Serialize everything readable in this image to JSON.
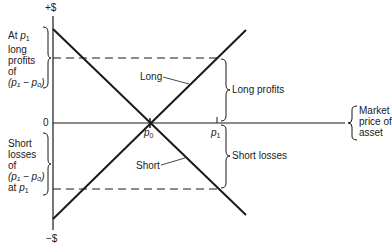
{
  "diagram": {
    "type": "payoff-diagram",
    "axes": {
      "y_top": "+$",
      "y_bottom": "−$",
      "origin": "0",
      "x_label_lines": [
        "Market",
        "price of",
        "asset"
      ]
    },
    "points": {
      "p0": "p",
      "p0_sub": "0",
      "p1": "p",
      "p1_sub": "1"
    },
    "lines": {
      "long": "Long",
      "short": "Short"
    },
    "braces": {
      "long_profits": "Long profits",
      "short_losses": "Short losses"
    },
    "left_top_note": {
      "line1_prefix": "At ",
      "line1_var": "p",
      "line1_sub": "1",
      "line2": "long",
      "line3": "profits",
      "line4": "of",
      "line5": "(p₁ − p₀)"
    },
    "left_bottom_note": {
      "line1": "Short",
      "line2": "losses",
      "line3": "of",
      "line4": "(p₁ − p₀)",
      "line5_prefix": "at ",
      "line5_var": "p",
      "line5_sub": "1"
    },
    "colors": {
      "ink": "#1a1a1a",
      "background": "#ffffff"
    }
  }
}
